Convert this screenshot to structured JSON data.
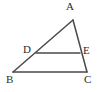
{
  "figure": {
    "type": "geometry-diagram",
    "background_color": "#ffffff",
    "stroke_color": "#4a4a4a",
    "label_color": "#2b2b2b",
    "stroke_width": 1.5,
    "width": 101,
    "height": 92,
    "points": {
      "A": {
        "label": "A",
        "x": 73,
        "y": 20
      },
      "B": {
        "label": "B",
        "x": 13,
        "y": 72
      },
      "C": {
        "label": "C",
        "x": 87,
        "y": 72
      },
      "D": {
        "label": "D",
        "x": 36,
        "y": 53
      },
      "E": {
        "label": "E",
        "x": 80,
        "y": 53
      }
    },
    "segments": [
      {
        "name": "AB",
        "from": "A",
        "to": "B"
      },
      {
        "name": "AC",
        "from": "A",
        "to": "C"
      },
      {
        "name": "BC",
        "from": "B",
        "to": "C"
      },
      {
        "name": "DE",
        "from": "D",
        "to": "E"
      }
    ]
  }
}
